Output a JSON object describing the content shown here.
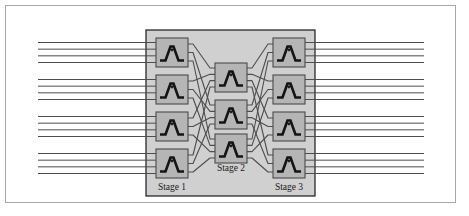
{
  "figure": {
    "frame": {
      "border_color": "#a8a8a8",
      "background": "#ffffff"
    }
  },
  "panel": {
    "name": "network-panel",
    "fill": "#d0d0d0",
    "stroke": "#1a1a1a",
    "x": 146,
    "y": 30,
    "width": 169,
    "height": 166
  },
  "colors": {
    "switch_fill": "#b5b5b5",
    "switch_stroke": "#4a4a4a",
    "switch_glyph": "#141414",
    "link_line": "#4d4d4d",
    "panel_fill": "#d0d0d0",
    "panel_stroke": "#1a1a1a",
    "frame_stroke": "#a8a8a8"
  },
  "stages": [
    {
      "id": "stage-1",
      "label": "Stage 1",
      "label_x": 172,
      "label_y": 190,
      "switch_count": 4,
      "box_width": 32,
      "box_height": 29,
      "box_x": 156,
      "box_ys": [
        38,
        75,
        112,
        149
      ],
      "external_ports_per_switch": 4,
      "internal_ports_per_switch": 3
    },
    {
      "id": "stage-2",
      "label": "Stage 2",
      "label_x": 231,
      "label_y": 171,
      "switch_count": 3,
      "box_width": 32,
      "box_height": 29,
      "box_x": 215,
      "box_ys": [
        63,
        100,
        134
      ],
      "external_ports_per_switch": 0,
      "internal_ports_per_switch": 4
    },
    {
      "id": "stage-3",
      "label": "Stage 3",
      "label_x": 289,
      "label_y": 190,
      "switch_count": 4,
      "box_width": 32,
      "box_height": 29,
      "box_x": 273,
      "box_ys": [
        38,
        75,
        112,
        149
      ],
      "external_ports_per_switch": 4,
      "internal_ports_per_switch": 3
    }
  ],
  "io": {
    "input_lines_total": 16,
    "output_lines_total": 16,
    "input_x_start": 38,
    "input_x_end": 156,
    "output_x_start": 305,
    "output_x_end": 424,
    "line_color": "#4d4d4d",
    "line_width": 1
  },
  "switch_glyph": {
    "name": "crossbar-switch-icon",
    "description": "dark chevron / peak symbol denoting a crossbar switching element"
  }
}
